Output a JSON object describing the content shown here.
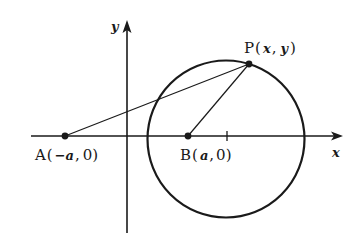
{
  "diagram": {
    "type": "geometry-figure",
    "colors": {
      "stroke": "#1a1a1a",
      "background": "#ffffff"
    },
    "axes": {
      "x_label": "x",
      "y_label": "y"
    },
    "points": {
      "A": {
        "name": "A",
        "open": "(",
        "coords": [
          "−a",
          "0"
        ],
        "close": ")"
      },
      "B": {
        "name": "B",
        "open": "(",
        "coords": [
          "a",
          "0"
        ],
        "close": ")"
      },
      "P": {
        "name": "P",
        "open": "(",
        "coords": [
          "x",
          "y"
        ],
        "close": ")"
      }
    },
    "labels": {
      "A_full": "A(−a, 0)",
      "B_full": "B(a, 0)",
      "P_full": "P(x, y)"
    },
    "segments": [
      "A–P",
      "B–P"
    ],
    "circle": {
      "center_tick_mark": true
    }
  }
}
